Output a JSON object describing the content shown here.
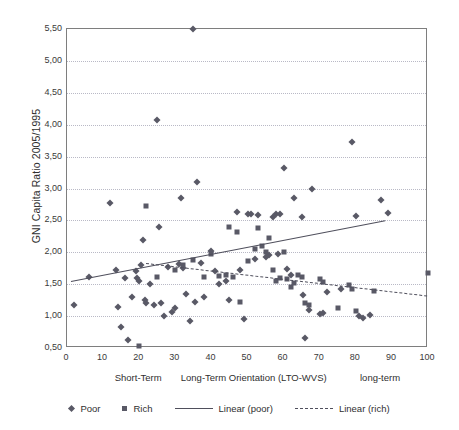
{
  "chart_data": {
    "type": "scatter",
    "title": "",
    "xlabel": "Long-Term Orientation (LTO-WVS)",
    "ylabel": "GNI Capita Ratio 2005/1995",
    "xlim": [
      0,
      100
    ],
    "ylim": [
      0.5,
      5.5
    ],
    "grid": true,
    "y_tick_step": 0.5,
    "x_tick_step": 10,
    "yticks": [
      "0,50",
      "1,00",
      "1,50",
      "2,00",
      "2,50",
      "3,00",
      "3,50",
      "4,00",
      "4,50",
      "5,00",
      "5,50"
    ],
    "ytick_values": [
      0.5,
      1.0,
      1.5,
      2.0,
      2.5,
      3.0,
      3.5,
      4.0,
      4.5,
      5.0,
      5.5
    ],
    "xticks": [
      "0",
      "10",
      "20",
      "30",
      "40",
      "50",
      "60",
      "70",
      "80",
      "90",
      "100"
    ],
    "xtick_values": [
      0,
      10,
      20,
      30,
      40,
      50,
      60,
      70,
      80,
      90,
      100
    ],
    "x_captions": [
      {
        "label": "Short-Term",
        "at": 20
      },
      {
        "label": "Long-Term Orientation (LTO-WVS)",
        "at": 52
      },
      {
        "label": "long-term",
        "at": 87
      }
    ],
    "legend_position": "bottom",
    "legend": [
      {
        "label": "Poor",
        "marker": "diamond"
      },
      {
        "label": "Rich",
        "marker": "square"
      },
      {
        "label": "Linear (poor)",
        "marker": "solid-line"
      },
      {
        "label": "Linear (rich)",
        "marker": "dashed-line"
      }
    ],
    "series": [
      {
        "name": "Poor",
        "marker": "diamond",
        "color": "#595966",
        "points": [
          [
            2.0,
            1.17
          ],
          [
            6.0,
            1.62
          ],
          [
            12.0,
            2.77
          ],
          [
            13.5,
            1.73
          ],
          [
            14.0,
            1.15
          ],
          [
            15.0,
            0.83
          ],
          [
            16.0,
            1.6
          ],
          [
            17.0,
            0.62
          ],
          [
            18.0,
            1.3
          ],
          [
            19.0,
            1.7
          ],
          [
            19.5,
            1.6
          ],
          [
            20.0,
            1.55
          ],
          [
            20.5,
            1.8
          ],
          [
            21.0,
            2.2
          ],
          [
            21.5,
            1.25
          ],
          [
            22.0,
            1.2
          ],
          [
            23.0,
            1.5
          ],
          [
            24.0,
            1.18
          ],
          [
            25.0,
            4.08
          ],
          [
            25.5,
            2.4
          ],
          [
            26.0,
            1.21
          ],
          [
            27.0,
            1.0
          ],
          [
            28.0,
            1.77
          ],
          [
            29.0,
            1.07
          ],
          [
            30.0,
            1.13
          ],
          [
            31.0,
            1.82
          ],
          [
            31.5,
            2.85
          ],
          [
            32.0,
            1.75
          ],
          [
            33.0,
            1.35
          ],
          [
            34.0,
            0.93
          ],
          [
            35.0,
            5.5
          ],
          [
            35.5,
            1.22
          ],
          [
            36.0,
            3.1
          ],
          [
            37.0,
            1.83
          ],
          [
            38.0,
            1.3
          ],
          [
            40.0,
            2.02
          ],
          [
            41.0,
            1.7
          ],
          [
            42.0,
            1.5
          ],
          [
            44.0,
            1.55
          ],
          [
            45.0,
            1.25
          ],
          [
            47.0,
            2.63
          ],
          [
            48.0,
            1.72
          ],
          [
            49.0,
            0.95
          ],
          [
            50.0,
            2.6
          ],
          [
            51.0,
            2.6
          ],
          [
            52.0,
            1.9
          ],
          [
            53.0,
            2.58
          ],
          [
            55.0,
            1.93
          ],
          [
            56.0,
            1.95
          ],
          [
            57.0,
            2.55
          ],
          [
            58.0,
            2.6
          ],
          [
            58.5,
            1.98
          ],
          [
            59.0,
            2.6
          ],
          [
            60.0,
            3.32
          ],
          [
            61.0,
            1.74
          ],
          [
            62.0,
            1.65
          ],
          [
            63.0,
            2.85
          ],
          [
            65.0,
            2.55
          ],
          [
            65.5,
            1.33
          ],
          [
            66.0,
            0.65
          ],
          [
            67.0,
            1.1
          ],
          [
            68.0,
            2.99
          ],
          [
            70.0,
            1.03
          ],
          [
            71.0,
            1.05
          ],
          [
            72.0,
            1.38
          ],
          [
            76.0,
            1.42
          ],
          [
            79.0,
            3.73
          ],
          [
            80.0,
            2.57
          ],
          [
            81.0,
            1.0
          ],
          [
            82.0,
            0.97
          ],
          [
            84.0,
            1.02
          ],
          [
            87.0,
            2.82
          ],
          [
            89.0,
            2.62
          ]
        ]
      },
      {
        "name": "Rich",
        "marker": "square",
        "color": "#595966",
        "points": [
          [
            20.0,
            0.53
          ],
          [
            22.0,
            2.72
          ],
          [
            25.0,
            1.62
          ],
          [
            30.0,
            1.72
          ],
          [
            32.0,
            1.8
          ],
          [
            35.0,
            1.88
          ],
          [
            38.0,
            1.62
          ],
          [
            40.0,
            1.98
          ],
          [
            42.0,
            1.63
          ],
          [
            44.0,
            1.65
          ],
          [
            45.0,
            2.4
          ],
          [
            46.0,
            1.62
          ],
          [
            47.0,
            2.32
          ],
          [
            48.0,
            1.22
          ],
          [
            50.0,
            1.86
          ],
          [
            52.0,
            2.05
          ],
          [
            53.0,
            2.38
          ],
          [
            54.0,
            2.1
          ],
          [
            55.0,
            2.0
          ],
          [
            56.0,
            2.22
          ],
          [
            57.0,
            1.72
          ],
          [
            58.0,
            1.55
          ],
          [
            59.0,
            1.6
          ],
          [
            60.0,
            2.0
          ],
          [
            61.0,
            1.58
          ],
          [
            62.0,
            1.45
          ],
          [
            63.0,
            1.52
          ],
          [
            64.0,
            1.65
          ],
          [
            65.0,
            1.62
          ],
          [
            66.0,
            1.2
          ],
          [
            67.0,
            1.18
          ],
          [
            70.0,
            1.58
          ],
          [
            71.0,
            1.53
          ],
          [
            75.0,
            1.12
          ],
          [
            78.0,
            1.48
          ],
          [
            79.0,
            1.42
          ],
          [
            80.0,
            1.08
          ],
          [
            85.0,
            1.4
          ],
          [
            100.0,
            1.68
          ]
        ]
      }
    ],
    "trendlines": [
      {
        "name": "Linear (poor)",
        "style": "solid",
        "x0": 1,
        "y0": 1.55,
        "x1": 88,
        "y1": 2.5
      },
      {
        "name": "Linear (rich)",
        "style": "dashed",
        "x0": 22,
        "y0": 1.83,
        "x1": 100,
        "y1": 1.32
      }
    ]
  }
}
